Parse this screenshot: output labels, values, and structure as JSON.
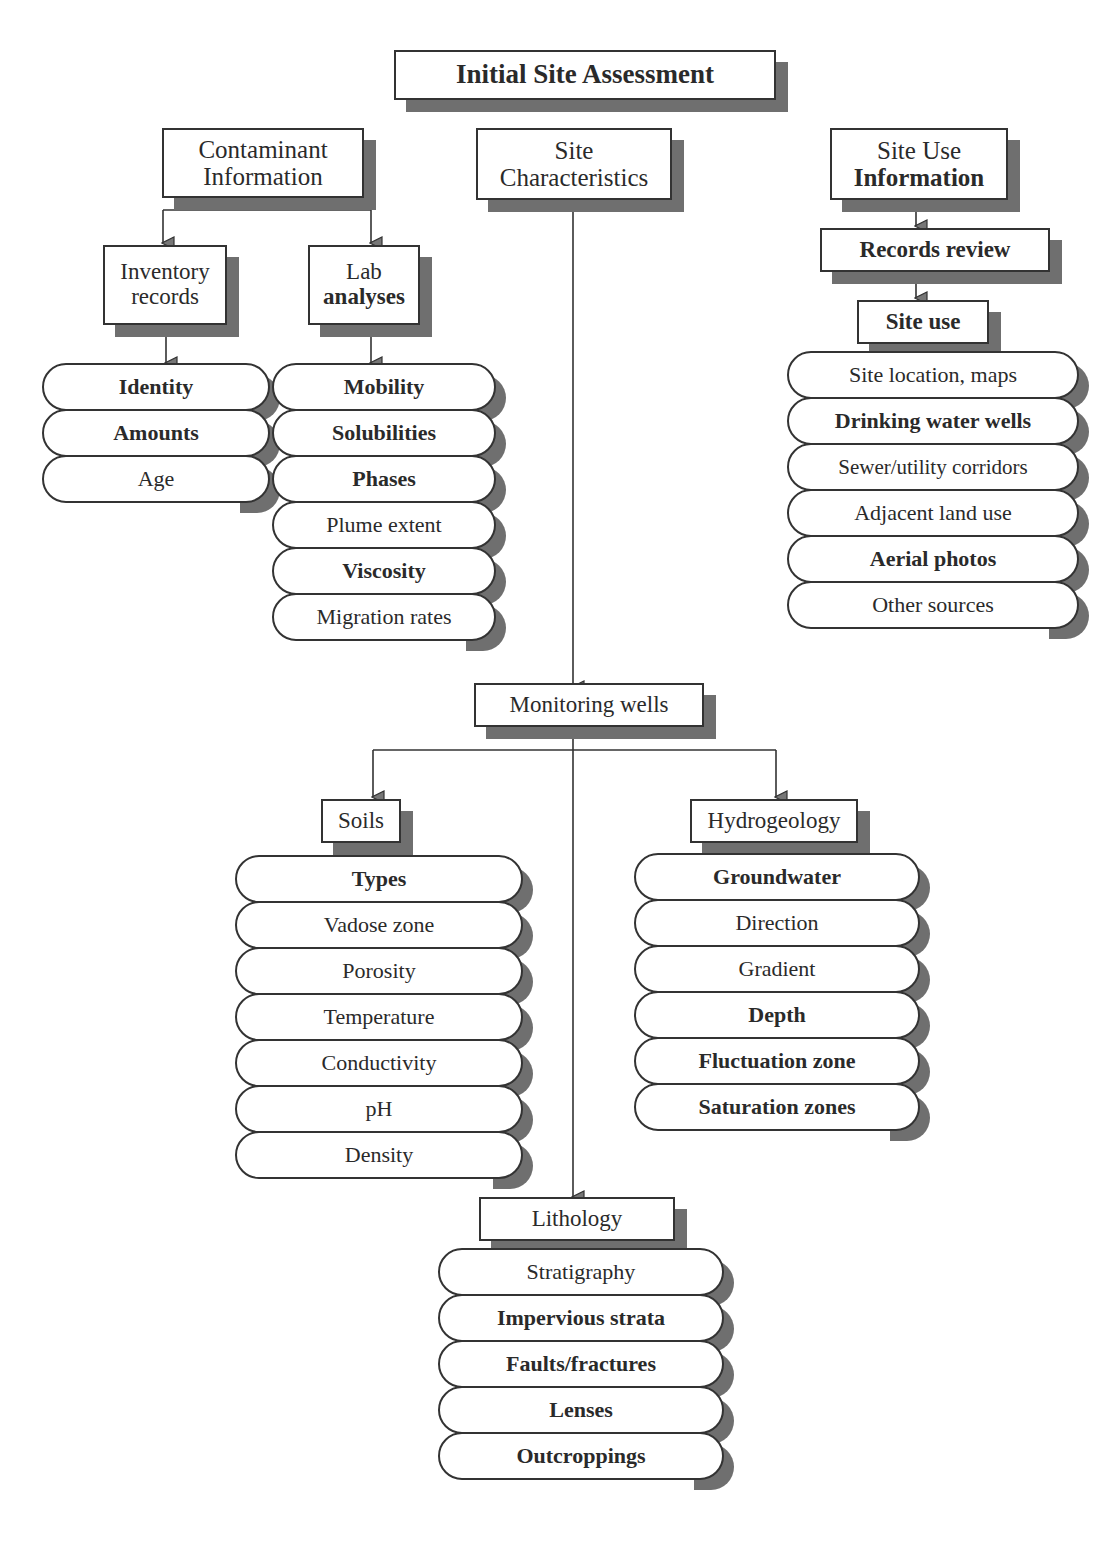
{
  "title": "Initial Site Assessment",
  "branches": {
    "contaminant": {
      "label_line1": "Contaminant",
      "label_line2": "Information",
      "inventory": {
        "label_line1": "Inventory",
        "label_line2": "records",
        "items": [
          "Identity",
          "Amounts",
          "Age"
        ]
      },
      "lab": {
        "label_line1": "Lab",
        "label_line2": "analyses",
        "items": [
          "Mobility",
          "Solubilities",
          "Phases",
          "Plume extent",
          "Viscosity",
          "Migration rates"
        ]
      }
    },
    "site_characteristics": {
      "label_line1": "Site",
      "label_line2": "Characteristics"
    },
    "site_use_info": {
      "label_line1": "Site Use",
      "label_line2": "Information",
      "records_review": "Records review",
      "site_use": "Site use",
      "items": [
        "Site location, maps",
        "Drinking water wells",
        "Sewer/utility corridors",
        "Adjacent land use",
        "Aerial photos",
        "Other sources"
      ]
    }
  },
  "monitoring_wells": {
    "label": "Monitoring wells",
    "soils": {
      "label": "Soils",
      "items": [
        "Types",
        "Vadose zone",
        "Porosity",
        "Temperature",
        "Conductivity",
        "pH",
        "Density"
      ]
    },
    "hydrogeology": {
      "label": "Hydrogeology",
      "items": [
        "Groundwater",
        "Direction",
        "Gradient",
        "Depth",
        "Fluctuation zone",
        "Saturation zones"
      ]
    },
    "lithology": {
      "label": "Lithology",
      "items": [
        "Stratigraphy",
        "Impervious strata",
        "Faults/fractures",
        "Lenses",
        "Outcroppings"
      ]
    }
  },
  "colors": {
    "line": "#333333",
    "shadow": "#6f6f6f",
    "fill": "#ffffff"
  }
}
